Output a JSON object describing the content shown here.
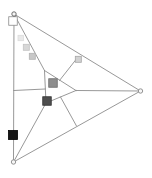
{
  "figure": {
    "width": 152,
    "height": 178,
    "background": "#ffffff",
    "line_color": "#8c8c8c",
    "line_width": 0.9,
    "vertices": [
      {
        "name": "vertex-top-left",
        "x": 14,
        "y": 14,
        "r": 2.2,
        "stroke": "#5f5f5f",
        "fill": "#f6f6f6"
      },
      {
        "name": "vertex-bottom-left",
        "x": 13.5,
        "y": 162,
        "r": 2.2,
        "stroke": "#8a8a8a",
        "fill": "#f6f6f6"
      },
      {
        "name": "vertex-right",
        "x": 140.5,
        "y": 91,
        "r": 2.2,
        "stroke": "#8a8a8a",
        "fill": "#f6f6f6"
      }
    ],
    "segments": [
      {
        "name": "side-left",
        "x1": 14,
        "y1": 14,
        "x2": 13.5,
        "y2": 162
      },
      {
        "name": "side-top",
        "x1": 14,
        "y1": 14,
        "x2": 140.5,
        "y2": 91
      },
      {
        "name": "side-bottom",
        "x1": 13.5,
        "y1": 162,
        "x2": 140.5,
        "y2": 91
      },
      {
        "name": "inner-edge-top",
        "x1": 44.5,
        "y1": 70.5,
        "x2": 76,
        "y2": 90.5
      },
      {
        "name": "inner-edge-left",
        "x1": 44.5,
        "y1": 70.5,
        "x2": 46,
        "y2": 103
      },
      {
        "name": "inner-edge-bottom",
        "x1": 46,
        "y1": 103,
        "x2": 76,
        "y2": 90.5
      },
      {
        "name": "median-a-upper",
        "x1": 14,
        "y1": 14,
        "x2": 44.5,
        "y2": 70.5
      },
      {
        "name": "median-a-lower",
        "x1": 60.5,
        "y1": 97,
        "x2": 76.5,
        "y2": 126
      },
      {
        "name": "median-b-lower",
        "x1": 13.5,
        "y1": 162,
        "x2": 46,
        "y2": 103
      },
      {
        "name": "median-b-upper",
        "x1": 59.5,
        "y1": 80.5,
        "x2": 78,
        "y2": 57
      },
      {
        "name": "median-c-right",
        "x1": 140.5,
        "y1": 91,
        "x2": 76,
        "y2": 90.5
      },
      {
        "name": "median-c-left",
        "x1": 45.3,
        "y1": 89,
        "x2": 13.7,
        "y2": 90.5
      }
    ],
    "markers": [
      {
        "name": "marker-square-white",
        "x": 13,
        "y": 21,
        "size": 8.5,
        "fill": "#ffffff",
        "stroke": "#8a8a8a"
      },
      {
        "name": "marker-square-light-1",
        "x": 20.7,
        "y": 38,
        "size": 5.4,
        "fill": "#e9e9e9",
        "stroke": "#dcdcdc"
      },
      {
        "name": "marker-square-light-2",
        "x": 26.3,
        "y": 47.3,
        "size": 6,
        "fill": "#d7d7d7",
        "stroke": "#c2c2c2"
      },
      {
        "name": "marker-square-light-3",
        "x": 32.3,
        "y": 56.3,
        "size": 6,
        "fill": "#c8c8c8",
        "stroke": "#b2b2b2"
      },
      {
        "name": "marker-square-midside",
        "x": 78.3,
        "y": 59.3,
        "size": 6,
        "fill": "#d2d2d2",
        "stroke": "#a6a6a6"
      },
      {
        "name": "marker-square-centroid",
        "x": 53,
        "y": 83,
        "size": 8.5,
        "fill": "#8e8e8e",
        "stroke": "#6a6a6a"
      },
      {
        "name": "marker-square-dark",
        "x": 47,
        "y": 101,
        "size": 8.5,
        "fill": "#4e4e4e",
        "stroke": "#303030"
      },
      {
        "name": "marker-square-black",
        "x": 13,
        "y": 135,
        "size": 9,
        "fill": "#161616",
        "stroke": "#000000"
      }
    ]
  }
}
